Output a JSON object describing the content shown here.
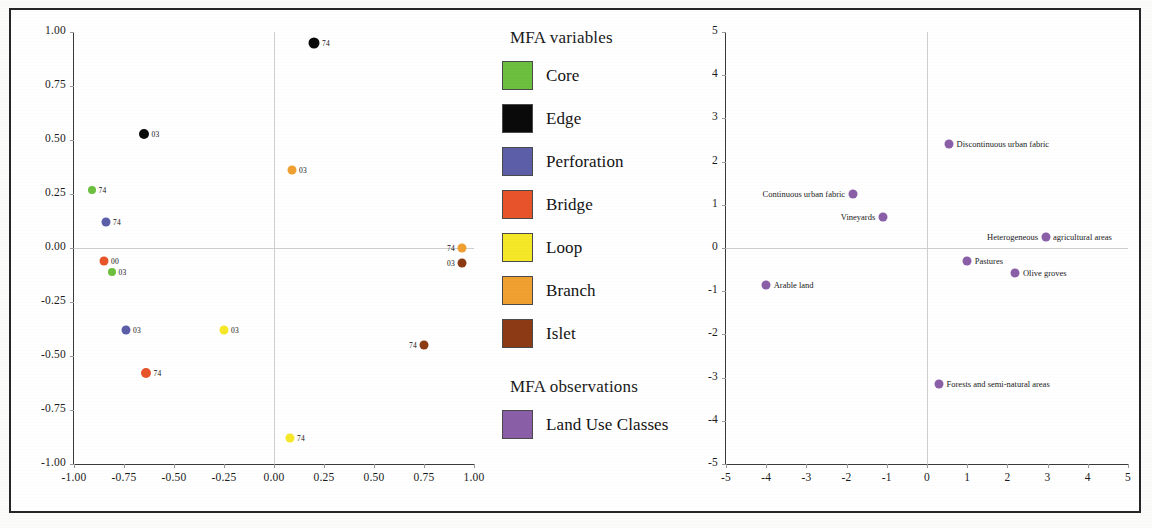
{
  "figure": {
    "background": "#ffffff",
    "frame_color": "#262626"
  },
  "legend": {
    "title_variables": "MFA variables",
    "title_observations": "MFA observations",
    "variables": [
      {
        "label": "Core",
        "color": "#6CBF3F"
      },
      {
        "label": "Edge",
        "color": "#0A0A0A"
      },
      {
        "label": "Perforation",
        "color": "#5C5FA8"
      },
      {
        "label": "Bridge",
        "color": "#E8542A"
      },
      {
        "label": "Loop",
        "color": "#F5E828"
      },
      {
        "label": "Branch",
        "color": "#F0A030"
      },
      {
        "label": "Islet",
        "color": "#8B3A14"
      }
    ],
    "observations": [
      {
        "label": "Land Use Classes",
        "color": "#8B5FA8"
      }
    ]
  },
  "chart_data": [
    {
      "type": "scatter",
      "title": "MFA variables factor map",
      "xlabel": "",
      "ylabel": "",
      "xlim": [
        -1.0,
        1.0
      ],
      "ylim": [
        -1.0,
        1.0
      ],
      "xticks": [
        "-1.00",
        "-0.75",
        "-0.50",
        "-0.25",
        "0.00",
        "0.25",
        "0.50",
        "0.75",
        "1.00"
      ],
      "yticks": [
        "1.00",
        "0.75",
        "0.50",
        "0.25",
        "0.00",
        "-0.25",
        "-0.50",
        "-0.75",
        "-1.00"
      ],
      "xtick_values": [
        -1.0,
        -0.75,
        -0.5,
        -0.25,
        0,
        0.25,
        0.5,
        0.75,
        1.0
      ],
      "ytick_values": [
        1.0,
        0.75,
        0.5,
        0.25,
        0,
        -0.25,
        -0.5,
        -0.75,
        -1.0
      ],
      "grid": false,
      "zero_lines": true,
      "legend_position": "center-right",
      "points": [
        {
          "group": "Edge",
          "label": "74",
          "x": 0.2,
          "y": 0.95,
          "color": "#0A0A0A",
          "r": 5.5,
          "label_side": "right"
        },
        {
          "group": "Edge",
          "label": "03",
          "x": -0.65,
          "y": 0.53,
          "color": "#0A0A0A",
          "r": 5.0,
          "label_side": "right"
        },
        {
          "group": "Branch",
          "label": "03",
          "x": 0.09,
          "y": 0.36,
          "color": "#F0A030",
          "r": 4.5,
          "label_side": "right"
        },
        {
          "group": "Core",
          "label": "74",
          "x": -0.91,
          "y": 0.27,
          "color": "#6CBF3F",
          "r": 4.0,
          "label_side": "right"
        },
        {
          "group": "Perforation",
          "label": "74",
          "x": -0.84,
          "y": 0.12,
          "color": "#5C5FA8",
          "r": 4.5,
          "label_side": "right"
        },
        {
          "group": "Branch",
          "label": "74",
          "x": 0.94,
          "y": 0.0,
          "color": "#F0A030",
          "r": 4.5,
          "label_side": "left"
        },
        {
          "group": "Bridge",
          "label": "00",
          "x": -0.85,
          "y": -0.06,
          "color": "#E8542A",
          "r": 4.5,
          "label_side": "right"
        },
        {
          "group": "Islet",
          "label": "03",
          "x": 0.94,
          "y": -0.07,
          "color": "#8B3A14",
          "r": 4.5,
          "label_side": "left"
        },
        {
          "group": "Core",
          "label": "03",
          "x": -0.81,
          "y": -0.11,
          "color": "#6CBF3F",
          "r": 4.0,
          "label_side": "right"
        },
        {
          "group": "Perforation",
          "label": "03",
          "x": -0.74,
          "y": -0.38,
          "color": "#5C5FA8",
          "r": 4.5,
          "label_side": "right"
        },
        {
          "group": "Loop",
          "label": "03",
          "x": -0.25,
          "y": -0.38,
          "color": "#F5E828",
          "r": 4.5,
          "label_side": "right"
        },
        {
          "group": "Islet",
          "label": "74",
          "x": 0.75,
          "y": -0.45,
          "color": "#8B3A14",
          "r": 4.5,
          "label_side": "left"
        },
        {
          "group": "Bridge",
          "label": "74",
          "x": -0.64,
          "y": -0.58,
          "color": "#E8542A",
          "r": 5.0,
          "label_side": "right"
        },
        {
          "group": "Loop",
          "label": "74",
          "x": 0.08,
          "y": -0.88,
          "color": "#F5E828",
          "r": 4.5,
          "label_side": "right"
        }
      ]
    },
    {
      "type": "scatter",
      "title": "MFA observations factor map",
      "xlabel": "",
      "ylabel": "",
      "xlim": [
        -5,
        5
      ],
      "ylim": [
        -5,
        5
      ],
      "xticks": [
        "-5",
        "-4",
        "-3",
        "-2",
        "-1",
        "0",
        "1",
        "2",
        "3",
        "4",
        "5"
      ],
      "yticks": [
        "5",
        "4",
        "3",
        "2",
        "1",
        "0",
        "-1",
        "-2",
        "-3",
        "-4",
        "-5"
      ],
      "xtick_values": [
        -5,
        -4,
        -3,
        -2,
        -1,
        0,
        1,
        2,
        3,
        4,
        5
      ],
      "ytick_values": [
        5,
        4,
        3,
        2,
        1,
        0,
        -1,
        -2,
        -3,
        -4,
        -5
      ],
      "grid": false,
      "zero_lines": true,
      "point_color": "#8B5FA8",
      "points": [
        {
          "label": "Discontinuous urban fabric",
          "x": 0.55,
          "y": 2.4,
          "label_side": "right"
        },
        {
          "label": "Continuous urban fabric",
          "x": -1.85,
          "y": 1.25,
          "label_side": "left"
        },
        {
          "label": "Vineyards",
          "x": -1.1,
          "y": 0.72,
          "label_side": "left"
        },
        {
          "label": "Heterogeneous agricultural areas",
          "x": 2.95,
          "y": 0.25,
          "label_side": "split",
          "label_left": "Heterogeneous",
          "label_right": "agricultural areas"
        },
        {
          "label": "Pastures",
          "x": 1.0,
          "y": -0.3,
          "label_side": "right"
        },
        {
          "label": "Olive groves",
          "x": 2.2,
          "y": -0.58,
          "label_side": "right"
        },
        {
          "label": "Arable land",
          "x": -4.0,
          "y": -0.85,
          "label_side": "right"
        },
        {
          "label": "Forests and semi-natural areas",
          "x": 0.3,
          "y": -3.15,
          "label_side": "right"
        }
      ]
    }
  ]
}
